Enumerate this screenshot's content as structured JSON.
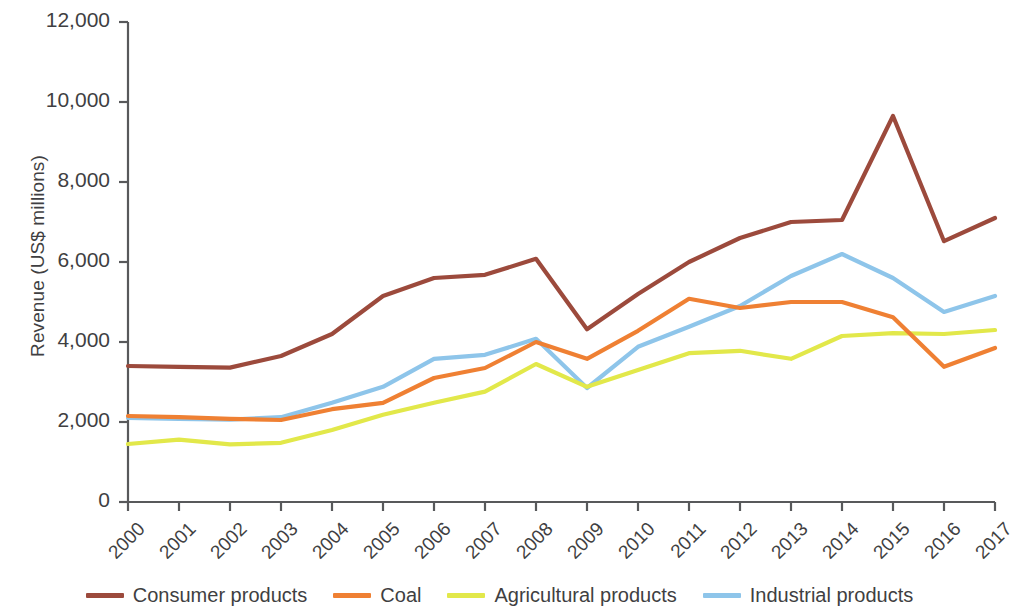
{
  "chart_data": {
    "type": "line",
    "title": "",
    "xlabel": "",
    "ylabel": "Revenue (US$ millions)",
    "ylim": [
      0,
      12000
    ],
    "ytick_labels": [
      "0",
      "2,000",
      "4,000",
      "6,000",
      "8,000",
      "10,000",
      "12,000"
    ],
    "ytick_values": [
      0,
      2000,
      4000,
      6000,
      8000,
      10000,
      12000
    ],
    "grid": false,
    "legend_position": "bottom",
    "categories": [
      "2000",
      "2001",
      "2002",
      "2003",
      "2004",
      "2005",
      "2006",
      "2007",
      "2008",
      "2009",
      "2010",
      "2011",
      "2012",
      "2013",
      "2014",
      "2015",
      "2016",
      "2017"
    ],
    "series": [
      {
        "name": "Consumer products",
        "color": "#9c4a3c",
        "values": [
          3400,
          3380,
          3360,
          3650,
          4200,
          5150,
          5600,
          5680,
          6080,
          4320,
          5200,
          6000,
          6600,
          7000,
          7050,
          9650,
          6520,
          7100
        ]
      },
      {
        "name": "Coal",
        "color": "#ef8033",
        "values": [
          2150,
          2120,
          2080,
          2050,
          2320,
          2480,
          3100,
          3350,
          4000,
          3580,
          4280,
          5080,
          4850,
          5000,
          5000,
          4620,
          3380,
          3850
        ]
      },
      {
        "name": "Agricultural products",
        "color": "#e2e84a",
        "values": [
          1450,
          1560,
          1440,
          1480,
          1800,
          2180,
          2480,
          2760,
          3450,
          2880,
          3300,
          3720,
          3780,
          3580,
          4150,
          4220,
          4200,
          4300
        ]
      },
      {
        "name": "Industrial products",
        "color": "#8ec5ea",
        "values": [
          2100,
          2080,
          2060,
          2120,
          2480,
          2880,
          3580,
          3680,
          4080,
          2850,
          3880,
          4380,
          4900,
          5650,
          6200,
          5600,
          4750,
          5150
        ]
      }
    ]
  },
  "legend": {
    "items": [
      {
        "label": "Consumer products",
        "color": "#9c4a3c",
        "swatch": "legend-swatch-consumer-products"
      },
      {
        "label": "Coal",
        "color": "#ef8033",
        "swatch": "legend-swatch-coal"
      },
      {
        "label": "Agricultural products",
        "color": "#e2e84a",
        "swatch": "legend-swatch-agricultural-products"
      },
      {
        "label": "Industrial products",
        "color": "#8ec5ea",
        "swatch": "legend-swatch-industrial-products"
      }
    ]
  },
  "axes": {
    "axis_color": "#58595b",
    "y_title": "Revenue (US$ millions)"
  }
}
